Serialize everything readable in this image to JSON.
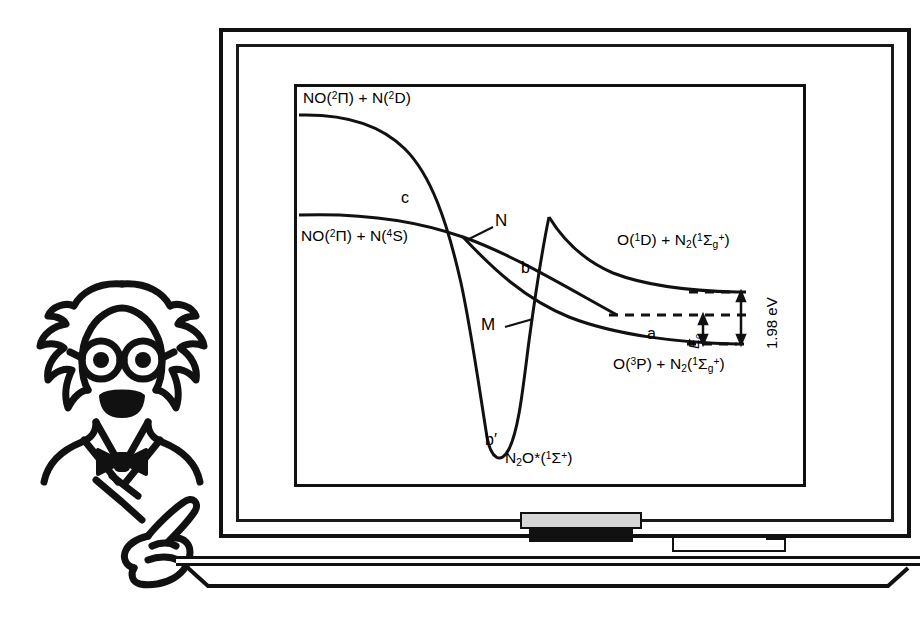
{
  "scene": {
    "title": "Blackboard potential energy diagram with cartoon scientist",
    "board": {
      "name": "blackboard"
    },
    "ledge_items": {
      "eraser": "eraser",
      "chalk": "chalk"
    },
    "figure": {
      "name": "cartoon-scientist",
      "pointing": "hand-pointing-icon"
    }
  },
  "chart_data": {
    "type": "line",
    "xlabel": "",
    "ylabel": "",
    "asymptote_labels": {
      "upper_left": "NO(²Π) + N(²D)",
      "lower_left": "NO(²Π) + N(⁴S)",
      "upper_right": "O(¹D) + N₂(¹Σg⁺)",
      "lower_right": "O(³P) + N₂(¹Σg⁺)",
      "well": "N₂O*(¹Σ⁺)"
    },
    "curve_labels": [
      "c",
      "b",
      "b′",
      "a"
    ],
    "crossing_points": [
      "N",
      "M"
    ],
    "energy_annotations": [
      {
        "label": "1.98 eV",
        "from": "O(³P) + N₂ asymptote",
        "to": "O(¹D) + N₂ asymptote"
      },
      {
        "label": "E₀",
        "from": "O(³P) + N₂ asymptote",
        "to": "M crossing level"
      }
    ],
    "series": [
      {
        "name": "b′",
        "description": "NO(2Pi)+N(2D) asymptote descending into deep N2O* well",
        "points": [
          [
            0,
            0.9
          ],
          [
            0.15,
            0.89
          ],
          [
            0.26,
            0.84
          ],
          [
            0.34,
            0.74
          ],
          [
            0.4,
            0.58
          ],
          [
            0.45,
            0.38
          ],
          [
            0.5,
            0.14
          ],
          [
            0.54,
            0.02
          ],
          [
            0.58,
            0.0
          ],
          [
            0.62,
            0.1
          ],
          [
            0.66,
            0.3
          ],
          [
            0.7,
            0.55
          ],
          [
            0.74,
            0.75
          ]
        ]
      },
      {
        "name": "c",
        "description": "NO(2Pi)+N(4S) asymptote sloping gently down through N to lower right",
        "points": [
          [
            0,
            0.64
          ],
          [
            0.12,
            0.635
          ],
          [
            0.25,
            0.62
          ],
          [
            0.36,
            0.595
          ],
          [
            0.43,
            0.565
          ],
          [
            0.5,
            0.52
          ],
          [
            0.58,
            0.46
          ],
          [
            0.66,
            0.4
          ],
          [
            0.74,
            0.345
          ]
        ]
      },
      {
        "name": "a",
        "description": "ground state leading to O(3P)+N2 asymptote",
        "points": [
          [
            0.4,
            0.72
          ],
          [
            0.47,
            0.6
          ],
          [
            0.54,
            0.5
          ],
          [
            0.62,
            0.42
          ],
          [
            0.72,
            0.36
          ],
          [
            0.84,
            0.335
          ],
          [
            1.0,
            0.33
          ]
        ]
      },
      {
        "name": "b",
        "description": "excited state leading to O(1D)+N2 asymptote",
        "points": [
          [
            0.38,
            0.3
          ],
          [
            0.45,
            0.4
          ],
          [
            0.52,
            0.49
          ],
          [
            0.6,
            0.55
          ],
          [
            0.72,
            0.585
          ],
          [
            0.86,
            0.6
          ],
          [
            1.0,
            0.605
          ]
        ]
      }
    ],
    "grid": false,
    "legend": "none"
  }
}
